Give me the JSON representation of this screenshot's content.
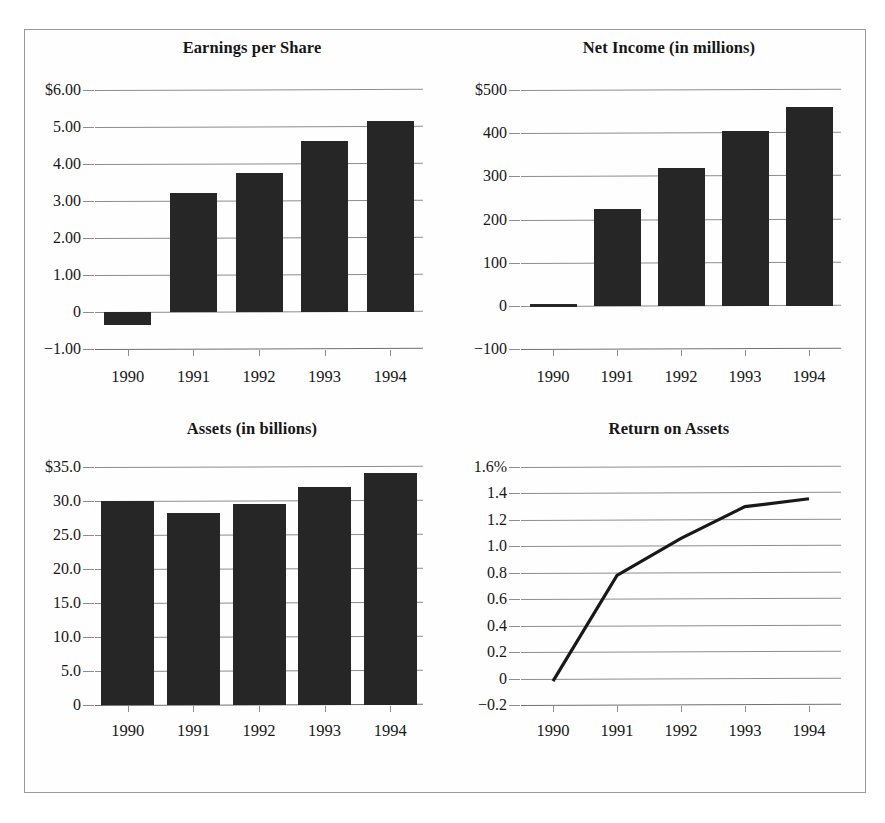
{
  "page": {
    "background": "#ffffff",
    "frame_color": "#9a9a9a"
  },
  "colors": {
    "bar_fill": "#262626",
    "line_stroke": "#181818",
    "gridline": "#8d8d8d",
    "text": "#171717"
  },
  "charts": [
    {
      "id": "earnings-per-share",
      "title": "Earnings per Share",
      "chart_data": {
        "type": "bar",
        "title": "Earnings per Share",
        "xlabel": "",
        "ylabel": "",
        "categories": [
          "1990",
          "1991",
          "1992",
          "1993",
          "1994"
        ],
        "values": [
          -0.35,
          3.22,
          3.75,
          4.62,
          5.15
        ],
        "ylim": [
          -1.0,
          6.0
        ],
        "yticks": [
          -1.0,
          0,
          1.0,
          2.0,
          3.0,
          4.0,
          5.0,
          6.0
        ],
        "ytick_labels": [
          "−1.00",
          "0",
          "1.00",
          "2.00",
          "3.00",
          "4.00",
          "5.00",
          "$6.00"
        ],
        "grid": true,
        "legend": false
      }
    },
    {
      "id": "net-income",
      "title": "Net Income (in millions)",
      "chart_data": {
        "type": "bar",
        "title": "Net Income (in millions)",
        "xlabel": "",
        "ylabel": "",
        "categories": [
          "1990",
          "1991",
          "1992",
          "1993",
          "1994"
        ],
        "values": [
          5,
          225,
          320,
          405,
          460
        ],
        "ylim": [
          -100,
          500
        ],
        "yticks": [
          -100,
          0,
          100,
          200,
          300,
          400,
          500
        ],
        "ytick_labels": [
          "−100",
          "0",
          "100",
          "200",
          "300",
          "400",
          "$500"
        ],
        "grid": true,
        "legend": false
      }
    },
    {
      "id": "assets",
      "title": "Assets (in billions)",
      "chart_data": {
        "type": "bar",
        "title": "Assets (in billions)",
        "xlabel": "",
        "ylabel": "",
        "categories": [
          "1990",
          "1991",
          "1992",
          "1993",
          "1994"
        ],
        "values": [
          30.0,
          28.2,
          29.5,
          32.0,
          34.1
        ],
        "ylim": [
          0,
          35.0
        ],
        "yticks": [
          0,
          5.0,
          10.0,
          15.0,
          20.0,
          25.0,
          30.0,
          35.0
        ],
        "ytick_labels": [
          "0",
          "5.0",
          "10.0",
          "15.0",
          "20.0",
          "25.0",
          "30.0",
          "$35.0"
        ],
        "grid": true,
        "legend": false
      }
    },
    {
      "id": "return-on-assets",
      "title": "Return on Assets",
      "chart_data": {
        "type": "line",
        "title": "Return on Assets",
        "xlabel": "",
        "ylabel": "",
        "categories": [
          "1990",
          "1991",
          "1992",
          "1993",
          "1994"
        ],
        "values": [
          -0.02,
          0.78,
          1.06,
          1.3,
          1.36
        ],
        "ylim": [
          -0.2,
          1.6
        ],
        "yticks": [
          -0.2,
          0,
          0.2,
          0.4,
          0.6,
          0.8,
          1.0,
          1.2,
          1.4,
          1.6
        ],
        "ytick_labels": [
          "−0.2",
          "0",
          "0.2",
          "0.4",
          "0.6",
          "0.8",
          "1.0",
          "1.2",
          "1.4",
          "1.6%"
        ],
        "grid": true,
        "legend": false
      }
    }
  ]
}
